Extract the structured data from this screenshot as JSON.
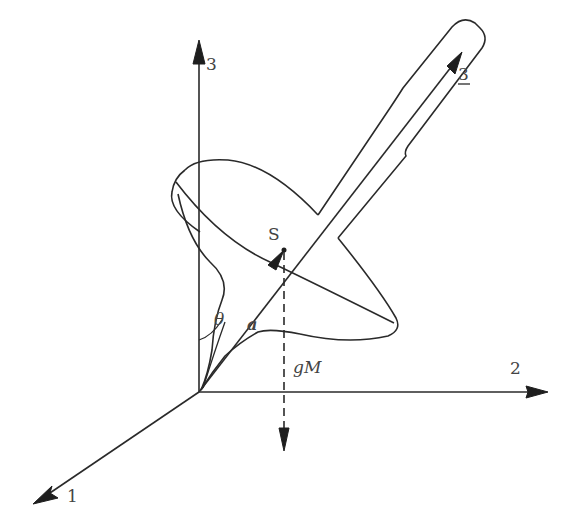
{
  "diagram": {
    "axes": {
      "axis_1_label": "1",
      "axis_2_label": "2",
      "axis_3_label": "3",
      "body_axis_label": "3"
    },
    "labels": {
      "center_of_mass": "S",
      "tilt_angle": "θ",
      "distance_vector": "a",
      "weight_force": "gM"
    },
    "colors": {
      "line": "#2a2a2a",
      "text": "#444444",
      "background": "#ffffff"
    }
  }
}
